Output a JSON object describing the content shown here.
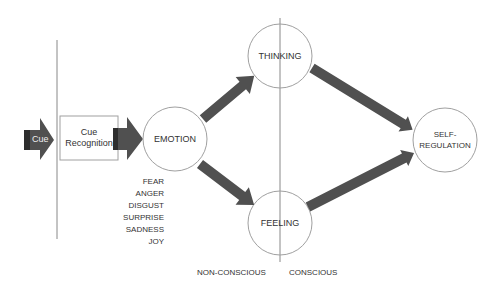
{
  "diagram": {
    "colors": {
      "arrow": "#505050",
      "arrow_dark": "#2e2e2e",
      "line": "#888888",
      "circle_stroke": "#a0a0a0",
      "box_stroke": "#a0a0a0",
      "text": "#333333"
    },
    "cue": {
      "label": "Cue"
    },
    "cue_recognition": {
      "line1": "Cue",
      "line2": "Recognition"
    },
    "nodes": {
      "emotion": "EMOTION",
      "thinking": "THINKING",
      "feeling": "FEELING",
      "self_regulation_line1": "SELF-",
      "self_regulation_line2": "REGULATION"
    },
    "emotions_list": [
      "FEAR",
      "ANGER",
      "DISGUST",
      "SURPRISE",
      "SADNESS",
      "JOY"
    ],
    "zones": {
      "non_conscious": "NON-CONSCIOUS",
      "conscious": "CONSCIOUS"
    }
  }
}
